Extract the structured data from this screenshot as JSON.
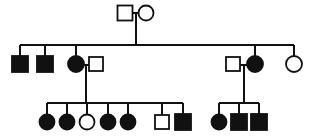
{
  "figure": {
    "kind": "pedigree-chart",
    "title": "",
    "width": 318,
    "height": 139,
    "background_color": "#ffffff",
    "line_color": "#111111",
    "affected_fill": "#111111",
    "unaffected_fill": "#ffffff"
  },
  "legend": {
    "square_meaning": "male",
    "circle_meaning": "female",
    "filled_meaning": "affected",
    "open_meaning": "unaffected"
  },
  "chart_data": {
    "type": "diagram",
    "title": "",
    "generations": [
      {
        "id": "I",
        "label": "I",
        "y": 13,
        "individuals": [
          {
            "id": "I-1",
            "sex": "male",
            "shape": "square",
            "affected": false,
            "x": 125,
            "y": 13,
            "size": 15
          },
          {
            "id": "I-2",
            "sex": "female",
            "shape": "circle",
            "affected": false,
            "x": 146,
            "y": 13,
            "size": 15
          }
        ]
      },
      {
        "id": "II",
        "label": "II",
        "y": 64,
        "individuals": [
          {
            "id": "II-1",
            "sex": "male",
            "shape": "square",
            "affected": true,
            "x": 20,
            "y": 64,
            "size": 16
          },
          {
            "id": "II-2",
            "sex": "male",
            "shape": "square",
            "affected": true,
            "x": 45,
            "y": 64,
            "size": 16
          },
          {
            "id": "II-3",
            "sex": "female",
            "shape": "circle",
            "affected": true,
            "x": 76,
            "y": 64,
            "size": 16
          },
          {
            "id": "II-4",
            "sex": "male",
            "shape": "square",
            "affected": false,
            "x": 96,
            "y": 64,
            "size": 14
          },
          {
            "id": "II-5",
            "sex": "male",
            "shape": "square",
            "affected": false,
            "x": 233,
            "y": 64,
            "size": 14
          },
          {
            "id": "II-6",
            "sex": "female",
            "shape": "circle",
            "affected": true,
            "x": 255,
            "y": 64,
            "size": 16
          },
          {
            "id": "II-7",
            "sex": "female",
            "shape": "circle",
            "affected": false,
            "x": 294,
            "y": 64,
            "size": 16
          }
        ]
      },
      {
        "id": "III",
        "label": "III",
        "y": 122,
        "individuals": [
          {
            "id": "III-1",
            "sex": "female",
            "shape": "circle",
            "affected": true,
            "x": 47,
            "y": 122,
            "size": 15
          },
          {
            "id": "III-2",
            "sex": "female",
            "shape": "circle",
            "affected": true,
            "x": 67,
            "y": 122,
            "size": 15
          },
          {
            "id": "III-3",
            "sex": "female",
            "shape": "circle",
            "affected": false,
            "x": 87,
            "y": 122,
            "size": 15
          },
          {
            "id": "III-4",
            "sex": "female",
            "shape": "circle",
            "affected": true,
            "x": 108,
            "y": 122,
            "size": 15
          },
          {
            "id": "III-5",
            "sex": "female",
            "shape": "circle",
            "affected": true,
            "x": 128,
            "y": 122,
            "size": 15
          },
          {
            "id": "III-6",
            "sex": "male",
            "shape": "square",
            "affected": false,
            "x": 162,
            "y": 122,
            "size": 14
          },
          {
            "id": "III-7",
            "sex": "male",
            "shape": "square",
            "affected": true,
            "x": 183,
            "y": 122,
            "size": 16
          },
          {
            "id": "III-8",
            "sex": "female",
            "shape": "circle",
            "affected": true,
            "x": 219,
            "y": 122,
            "size": 15
          },
          {
            "id": "III-9",
            "sex": "male",
            "shape": "square",
            "affected": true,
            "x": 239,
            "y": 122,
            "size": 16
          },
          {
            "id": "III-10",
            "sex": "male",
            "shape": "square",
            "affected": true,
            "x": 259,
            "y": 122,
            "size": 16
          }
        ]
      }
    ],
    "matings": [
      {
        "id": "mating-I",
        "partners": [
          "I-1",
          "I-2"
        ],
        "mate_line_y": 13,
        "descent_x": 136,
        "children": [
          "II-1",
          "II-2",
          "II-3",
          "II-6",
          "II-7"
        ],
        "sibship_line_y": 45
      },
      {
        "id": "mating-II-a",
        "partners": [
          "II-3",
          "II-4"
        ],
        "mate_line_y": 64,
        "descent_x": 86,
        "children": [
          "III-1",
          "III-2",
          "III-3",
          "III-4",
          "III-5",
          "III-6",
          "III-7"
        ],
        "sibship_line_y": 103
      },
      {
        "id": "mating-II-b",
        "partners": [
          "II-5",
          "II-6"
        ],
        "mate_line_y": 64,
        "descent_x": 244,
        "children": [
          "III-8",
          "III-9",
          "III-10"
        ],
        "sibship_line_y": 103
      }
    ],
    "counts": {
      "total_individuals": 19,
      "affected_total": 13,
      "unaffected_total": 6,
      "affected_males": 6,
      "affected_females": 7,
      "unaffected_males": 4,
      "unaffected_females": 2,
      "generation_count": 3
    }
  }
}
